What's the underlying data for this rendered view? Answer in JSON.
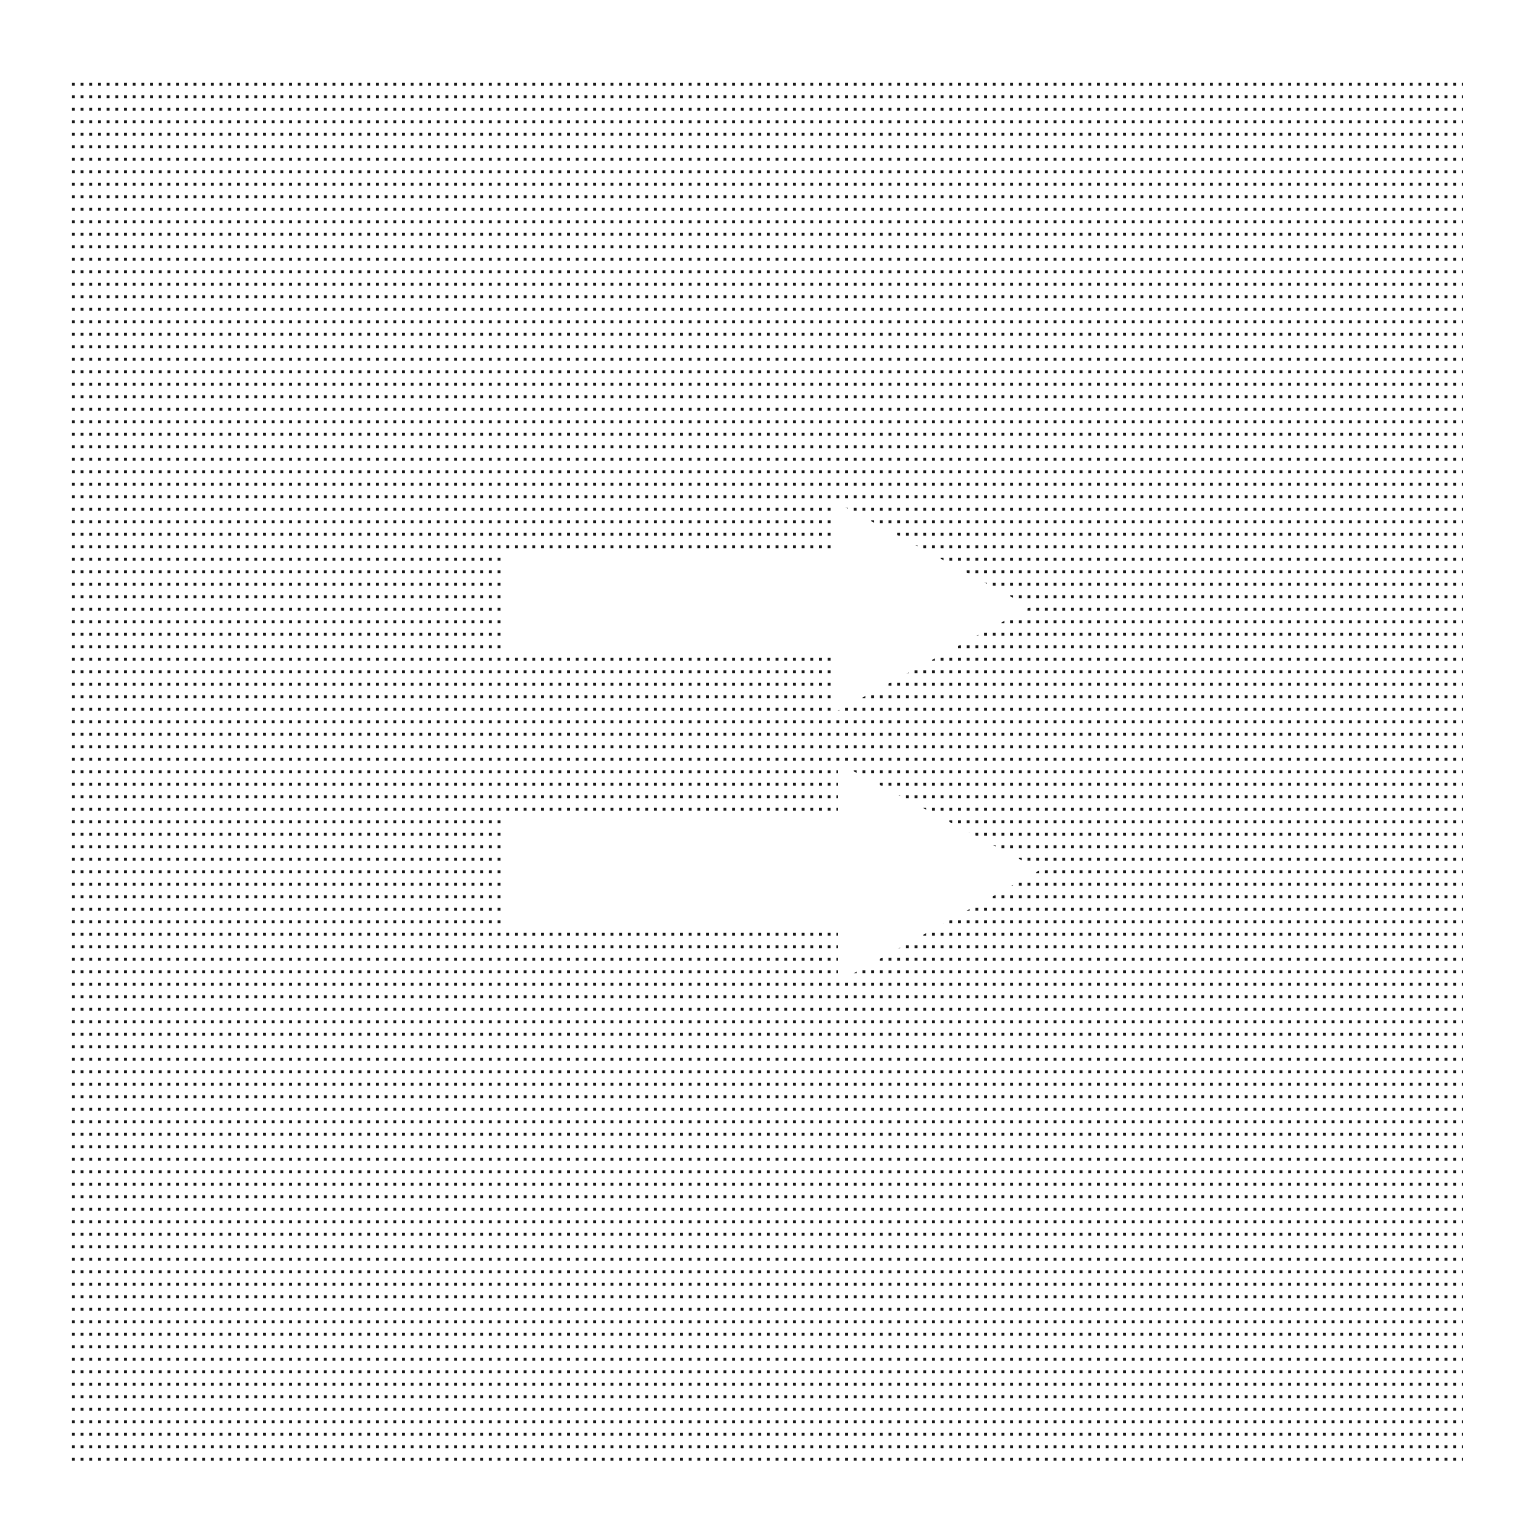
{
  "canvas": {
    "width": 1526,
    "height": 1538,
    "background": "#ffffff"
  },
  "pattern": {
    "type": "dot-grid",
    "dot_color": "#1a1a1a",
    "spacing_x": 8.7,
    "spacing_y": 12.5,
    "left": 69,
    "top": 78,
    "right": 1463,
    "bottom": 1466
  },
  "arrows": [
    {
      "name": "upper-arrow",
      "direction": "right",
      "fill": "#ffffff",
      "points": "503,552 832,552 832,500 1030,607 832,714 832,653 503,653"
    },
    {
      "name": "lower-arrow",
      "direction": "right",
      "fill": "#ffffff",
      "points": "503,813 838,813 838,763 1040,870 838,982 838,924 503,924"
    }
  ]
}
